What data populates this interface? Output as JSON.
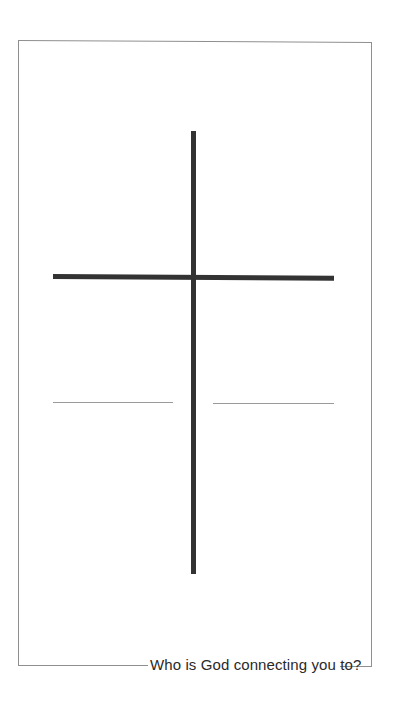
{
  "page": {
    "caption": "Who is God connecting you to?",
    "colors": {
      "background": "#ffffff",
      "frame": "#8f8f8f",
      "cross": "#333333",
      "write_lines": "#9a9a9a",
      "caption_text": "#2a2a2a"
    },
    "graphic": {
      "type": "cross",
      "write_lines": [
        "left-blank-line",
        "right-blank-line"
      ]
    }
  }
}
